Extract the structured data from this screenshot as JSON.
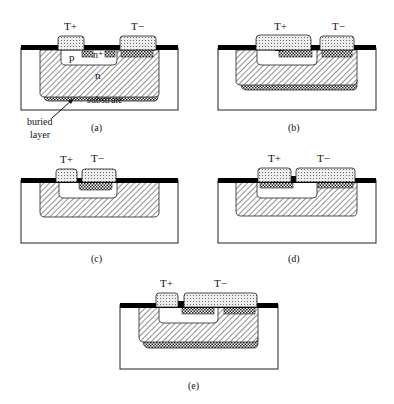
{
  "figure": {
    "panels": [
      {
        "id": "a",
        "caption": "(a)",
        "contact_plus": "T+",
        "contact_minus": "T−",
        "labels": {
          "p": "p",
          "n_plus": "n⁺",
          "n": "n",
          "substrate": "substrate",
          "buried_layer_line1": "buried",
          "buried_layer_line2": "layer"
        }
      },
      {
        "id": "b",
        "caption": "(b)",
        "contact_plus": "T+",
        "contact_minus": "T−"
      },
      {
        "id": "c",
        "caption": "(c)",
        "contact_plus": "T+",
        "contact_minus": "T−"
      },
      {
        "id": "d",
        "caption": "(d)",
        "contact_plus": "T+",
        "contact_minus": "T−"
      },
      {
        "id": "e",
        "caption": "(e)",
        "contact_plus": "T+",
        "contact_minus": "T−"
      }
    ]
  }
}
